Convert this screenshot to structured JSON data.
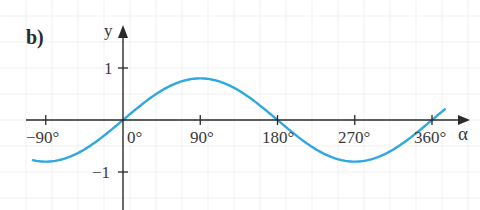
{
  "panel_label": "b)",
  "chart_data": {
    "type": "line",
    "title": "",
    "xlabel": "α",
    "ylabel": "y",
    "x_unit": "degrees",
    "xlim": [
      -105,
      375
    ],
    "ylim": [
      -1.2,
      1.4
    ],
    "x_ticks": [
      -90,
      90,
      180,
      270,
      360
    ],
    "x_tick_labels": [
      "−90°",
      "0°",
      "90°",
      "180°",
      "270°",
      "360°"
    ],
    "y_ticks": [
      1,
      -1
    ],
    "y_tick_labels": [
      "1",
      "−1"
    ],
    "grid": true,
    "legend": null,
    "series": [
      {
        "name": "y = 0.8·sin α",
        "color": "#2fa8df",
        "amplitude": 0.8,
        "x": [
          -105,
          -90,
          -45,
          0,
          45,
          90,
          135,
          180,
          225,
          270,
          315,
          360,
          375
        ],
        "y": [
          -0.77,
          -0.8,
          -0.57,
          0,
          0.57,
          0.8,
          0.57,
          0,
          -0.57,
          -0.8,
          -0.57,
          0,
          0.21
        ]
      }
    ]
  },
  "axes": {
    "x_label": "α",
    "y_label": "y",
    "x_tick_labels": [
      "−90°",
      "0°",
      "90°",
      "180°",
      "270°",
      "360°"
    ],
    "y_tick_labels": [
      "1",
      "−1"
    ]
  },
  "colors": {
    "curve": "#2fa8df",
    "axis": "#2a2a2a",
    "grid": "#eeeeee",
    "text": "#3a3a3a"
  }
}
